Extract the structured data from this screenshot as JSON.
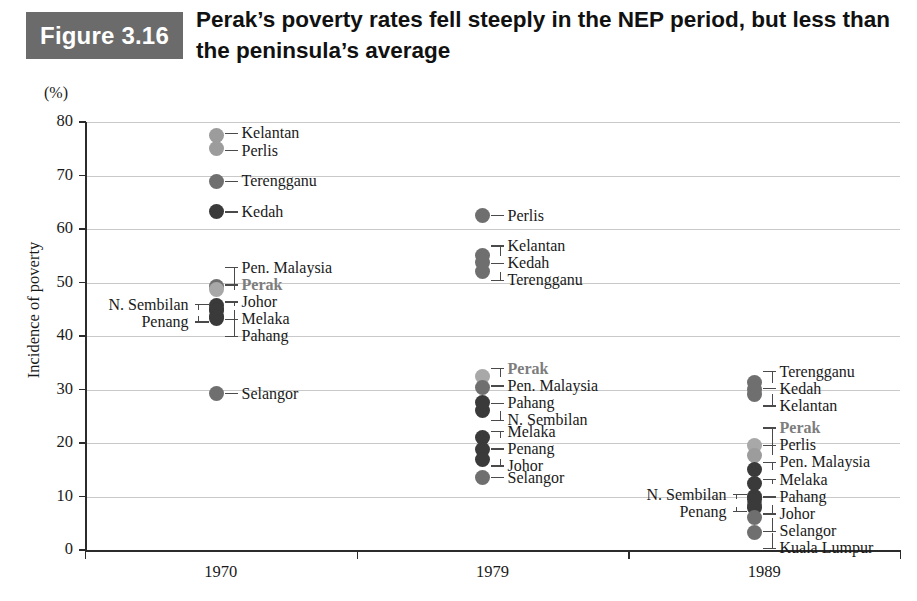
{
  "figure": {
    "badge": "Figure 3.16",
    "title": "Perak’s poverty rates fell steeply in the NEP period, but less than the peninsula’s average",
    "unit_label": "(%)"
  },
  "colors": {
    "badge_bg": "#6b6b6b",
    "perak": "#a8a8a8",
    "dot_dark": "#3a3a3a",
    "dot_mid": "#6f6f6f",
    "dot_light": "#9c9c9c",
    "gridline": "#c9c9c9",
    "axis": "#2b2b2b"
  },
  "chart_data": {
    "type": "scatter",
    "title": "Perak’s poverty rates fell steeply in the NEP period, but less than the peninsula’s average",
    "xlabel": "",
    "ylabel": "Incidence of poverty",
    "unit": "(%)",
    "ylim": [
      0,
      80
    ],
    "yticks": [
      0,
      10,
      20,
      30,
      40,
      50,
      60,
      70,
      80
    ],
    "grid": true,
    "legend": "none",
    "categories": [
      "1970",
      "1979",
      "1989"
    ],
    "highlight_series": "Perak",
    "series": [
      {
        "year": "1970",
        "points": [
          {
            "name": "Kelantan",
            "value": 77.5,
            "shade": "light",
            "label_side": "right"
          },
          {
            "name": "Perlis",
            "value": 75.0,
            "shade": "light",
            "label_side": "right"
          },
          {
            "name": "Terengganu",
            "value": 68.9,
            "shade": "mid",
            "label_side": "right"
          },
          {
            "name": "Kedah",
            "value": 63.2,
            "shade": "dark",
            "label_side": "right"
          },
          {
            "name": "Pen. Malaysia",
            "value": 49.3,
            "shade": "mid",
            "label_side": "right"
          },
          {
            "name": "Perak",
            "value": 48.6,
            "shade": "perak",
            "label_side": "right"
          },
          {
            "name": "Johor",
            "value": 45.7,
            "shade": "dark",
            "label_side": "right"
          },
          {
            "name": "Melaka",
            "value": 44.9,
            "shade": "dark",
            "label_side": "right"
          },
          {
            "name": "Pahang",
            "value": 43.2,
            "shade": "dark",
            "label_side": "right"
          },
          {
            "name": "N. Sembilan",
            "value": 44.8,
            "shade": "dark",
            "label_side": "left"
          },
          {
            "name": "Penang",
            "value": 43.7,
            "shade": "dark",
            "label_side": "left"
          },
          {
            "name": "Selangor",
            "value": 29.2,
            "shade": "mid",
            "label_side": "right"
          }
        ]
      },
      {
        "year": "1979",
        "points": [
          {
            "name": "Perlis",
            "value": 62.5,
            "shade": "mid",
            "label_side": "right"
          },
          {
            "name": "Kelantan",
            "value": 55.0,
            "shade": "mid",
            "label_side": "right"
          },
          {
            "name": "Kedah",
            "value": 53.8,
            "shade": "mid",
            "label_side": "right"
          },
          {
            "name": "Terengganu",
            "value": 52.0,
            "shade": "mid",
            "label_side": "right"
          },
          {
            "name": "Perak",
            "value": 32.4,
            "shade": "perak",
            "label_side": "right"
          },
          {
            "name": "Pen. Malaysia",
            "value": 30.3,
            "shade": "mid",
            "label_side": "right"
          },
          {
            "name": "Pahang",
            "value": 27.5,
            "shade": "dark",
            "label_side": "right"
          },
          {
            "name": "N. Sembilan",
            "value": 26.0,
            "shade": "dark",
            "label_side": "right"
          },
          {
            "name": "Melaka",
            "value": 21.0,
            "shade": "dark",
            "label_side": "right"
          },
          {
            "name": "Penang",
            "value": 18.7,
            "shade": "dark",
            "label_side": "right"
          },
          {
            "name": "Johor",
            "value": 17.0,
            "shade": "dark",
            "label_side": "right"
          },
          {
            "name": "Selangor",
            "value": 13.5,
            "shade": "mid",
            "label_side": "right"
          }
        ]
      },
      {
        "year": "1989",
        "points": [
          {
            "name": "Terengganu",
            "value": 31.3,
            "shade": "mid",
            "label_side": "right"
          },
          {
            "name": "Kedah",
            "value": 30.0,
            "shade": "mid",
            "label_side": "right"
          },
          {
            "name": "Kelantan",
            "value": 29.1,
            "shade": "mid",
            "label_side": "right"
          },
          {
            "name": "Perak",
            "value": 19.6,
            "shade": "perak",
            "label_side": "right"
          },
          {
            "name": "Perlis",
            "value": 17.7,
            "shade": "light",
            "label_side": "right"
          },
          {
            "name": "Pen. Malaysia",
            "value": 15.0,
            "shade": "dark",
            "label_side": "right"
          },
          {
            "name": "Melaka",
            "value": 12.4,
            "shade": "dark",
            "label_side": "right"
          },
          {
            "name": "Pahang",
            "value": 10.0,
            "shade": "dark",
            "label_side": "right"
          },
          {
            "name": "Johor",
            "value": 8.5,
            "shade": "mid",
            "label_side": "right"
          },
          {
            "name": "N. Sembilan",
            "value": 9.5,
            "shade": "dark",
            "label_side": "left"
          },
          {
            "name": "Penang",
            "value": 8.0,
            "shade": "dark",
            "label_side": "left"
          },
          {
            "name": "Selangor",
            "value": 6.0,
            "shade": "mid",
            "label_side": "right"
          },
          {
            "name": "Kuala Lumpur",
            "value": 3.2,
            "shade": "mid",
            "label_side": "right"
          }
        ]
      }
    ]
  }
}
